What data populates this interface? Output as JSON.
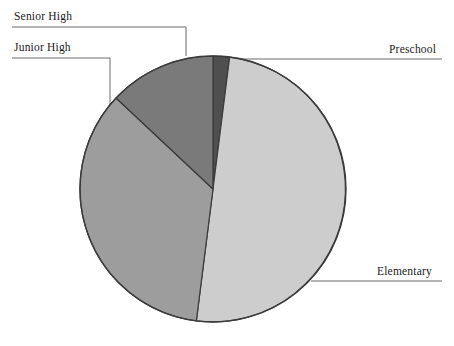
{
  "chart_data": {
    "type": "pie",
    "title": "",
    "subtitle": "",
    "xlabel": "",
    "ylabel": "",
    "legend_position": "none",
    "grid": false,
    "labels_placement": "leader-lines",
    "start_angle_deg": 0,
    "direction": "clockwise",
    "categories": [
      "Preschool",
      "Elementary",
      "Junior High",
      "Senior High"
    ],
    "values": [
      2,
      50,
      35,
      13
    ],
    "unit": "percent",
    "slices": [
      {
        "label": "Preschool",
        "value": 2,
        "percent": 2,
        "angle_deg": 7.2,
        "start_deg": 0,
        "end_deg": 7.2,
        "color": "#4f4f4f"
      },
      {
        "label": "Elementary",
        "value": 50,
        "percent": 50,
        "angle_deg": 180,
        "start_deg": 7.2,
        "end_deg": 187.2,
        "color": "#cdcdcd"
      },
      {
        "label": "Junior High",
        "value": 35,
        "percent": 35,
        "angle_deg": 126,
        "start_deg": 187.2,
        "end_deg": 313.2,
        "color": "#9d9d9d"
      },
      {
        "label": "Senior High",
        "value": 13,
        "percent": 13,
        "angle_deg": 46.8,
        "start_deg": 313.2,
        "end_deg": 360,
        "color": "#7a7a7a"
      }
    ]
  },
  "labels": {
    "senior_high": "Senior High",
    "junior_high": "Junior High",
    "preschool": "Preschool",
    "elementary": "Elementary"
  },
  "style": {
    "background": "#ffffff",
    "outline_color": "#3a3a3a",
    "leader_line_color": "#6b6b6b",
    "text_color": "#1a1a1a"
  }
}
